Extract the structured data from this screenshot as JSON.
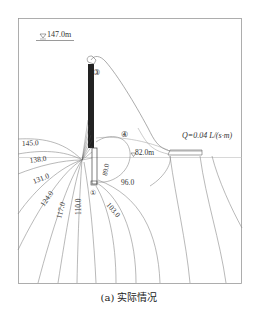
{
  "figure": {
    "caption": "(a) 实际情况",
    "water_level_top": "147.0m",
    "water_level_downstream": "82.0m",
    "discharge_label": "Q=0.04 L/(s·m)",
    "markers": [
      "①",
      "②",
      "③",
      "④"
    ],
    "contours": [
      {
        "id": "c145",
        "label": "145.0"
      },
      {
        "id": "c138",
        "label": "138.0"
      },
      {
        "id": "c131",
        "label": "131.0"
      },
      {
        "id": "c124",
        "label": "124.0"
      },
      {
        "id": "c117",
        "label": "117.0"
      },
      {
        "id": "c110",
        "label": "110.0"
      },
      {
        "id": "c103",
        "label": "103.0"
      },
      {
        "id": "c96",
        "label": "96.0"
      },
      {
        "id": "c89",
        "label": "89.0"
      }
    ],
    "colors": {
      "frame": "#9a9a9a",
      "contour": "#8a8a8a",
      "wall": "#222222",
      "text": "#333333"
    }
  }
}
